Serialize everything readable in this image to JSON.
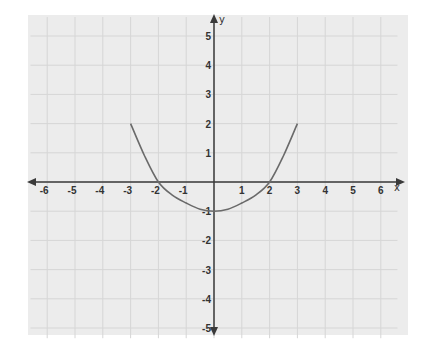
{
  "chart_data": {
    "type": "line",
    "title": "",
    "xlabel": "x",
    "ylabel": "y",
    "xlim": [
      -6,
      6
    ],
    "ylim": [
      -5,
      5
    ],
    "grid": true,
    "x_ticks": [
      -6,
      -5,
      -4,
      -3,
      -2,
      -1,
      1,
      2,
      3,
      4,
      5,
      6
    ],
    "y_ticks": [
      5,
      4,
      3,
      2,
      1,
      -1,
      -2,
      -3,
      -4,
      -5
    ],
    "series": [
      {
        "name": "curve",
        "x": [
          -3,
          -2.5,
          -2,
          -1.5,
          -1,
          -0.5,
          0,
          0.5,
          1,
          1.5,
          2,
          2.5,
          3
        ],
        "y": [
          2,
          0.9,
          0,
          -0.45,
          -0.72,
          -0.93,
          -1,
          -0.93,
          -0.72,
          -0.45,
          0,
          0.9,
          2
        ]
      }
    ],
    "key_points": [
      {
        "label": "vertex",
        "x": 0,
        "y": -1
      },
      {
        "label": "x-intercept",
        "x": -2,
        "y": 0
      },
      {
        "label": "x-intercept",
        "x": 2,
        "y": 0
      },
      {
        "label": "endpoint",
        "x": -3,
        "y": 2
      },
      {
        "label": "endpoint",
        "x": 3,
        "y": 2
      }
    ]
  },
  "style": {
    "background": "#ffffff",
    "plot_bg": "#ececec",
    "grid_color": "#d6d6d6",
    "axis_color": "#3a3a3a",
    "curve_color": "#6a6a6a"
  }
}
